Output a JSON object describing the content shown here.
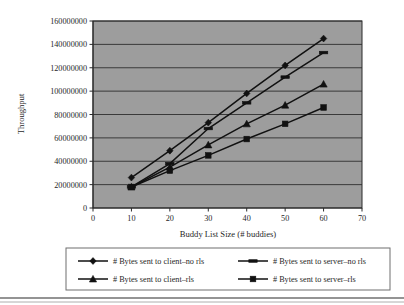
{
  "chart_data": {
    "type": "line",
    "title": "",
    "xlabel": "Buddy List Size (# buddies)",
    "ylabel": "Throughput",
    "x": [
      10,
      20,
      30,
      40,
      50,
      60
    ],
    "xlim": [
      0,
      70
    ],
    "ylim": [
      0,
      160000000
    ],
    "xticks": [
      "0",
      "10",
      "20",
      "30",
      "40",
      "50",
      "60",
      "70"
    ],
    "yticks": [
      "0",
      "20000000",
      "40000000",
      "60000000",
      "80000000",
      "100000000",
      "120000000",
      "140000000",
      "160000000"
    ],
    "grid": "horizontal",
    "legend_position": "bottom",
    "plot_background": "#9d9d9d",
    "line_color": "#111111",
    "series": [
      {
        "name": "# Bytes sent to client–no rls",
        "marker": "diamond",
        "values": [
          26000000,
          49000000,
          73000000,
          98000000,
          122000000,
          145000000
        ]
      },
      {
        "name": "# Bytes sent to server–no rls",
        "marker": "dash",
        "values": [
          18000000,
          38000000,
          68000000,
          90000000,
          112000000,
          133000000
        ]
      },
      {
        "name": "# Bytes sent to client–rls",
        "marker": "triangle",
        "values": [
          18000000,
          35000000,
          54000000,
          72000000,
          88000000,
          106000000
        ]
      },
      {
        "name": "# Bytes sent to server–rls",
        "marker": "square",
        "values": [
          18000000,
          32000000,
          45000000,
          59000000,
          72000000,
          86000000
        ]
      }
    ]
  }
}
